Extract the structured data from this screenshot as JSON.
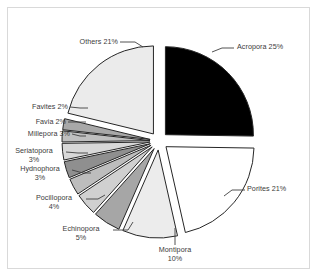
{
  "chart_data": {
    "type": "pie",
    "title": "",
    "subtitle": "",
    "xlabel": "",
    "ylabel": "",
    "legend_position": "none",
    "grid": false,
    "exploded": true,
    "units": "percent",
    "categories": [
      "Acropora",
      "Porites",
      "Montipora",
      "Echinopora",
      "Pocillopora",
      "Hydnophora",
      "Seriatopora",
      "Millepora",
      "Favia",
      "Favites",
      "Others"
    ],
    "values": [
      25,
      21,
      10,
      5,
      4,
      3,
      3,
      3,
      2,
      2,
      21
    ],
    "slice_colors": [
      "#000000",
      "#ffffff",
      "#ececec",
      "#a6a6a6",
      "#d0d0d0",
      "#bdbdbd",
      "#8f8f8f",
      "#d8d8d8",
      "#bfbfbf",
      "#a8a8a8",
      "#ebebeb"
    ],
    "labels": [
      {
        "name": "Acropora",
        "value": 25,
        "text": "Acropora 25%",
        "line1": "Acropora 25%",
        "line2": ""
      },
      {
        "name": "Porites",
        "value": 21,
        "text": "Porites 21%",
        "line1": "Porites 21%",
        "line2": ""
      },
      {
        "name": "Montipora",
        "value": 10,
        "text": "Montipora 10%",
        "line1": "Montipora",
        "line2": "10%"
      },
      {
        "name": "Echinopora",
        "value": 5,
        "text": "Echinopora 5%",
        "line1": "Echinopora",
        "line2": "5%"
      },
      {
        "name": "Pocillopora",
        "value": 4,
        "text": "Pocillopora 4%",
        "line1": "Pocillopora",
        "line2": "4%"
      },
      {
        "name": "Hydnophora",
        "value": 3,
        "text": "Hydnophora 3%",
        "line1": "Hydnophora",
        "line2": "3%"
      },
      {
        "name": "Seriatopora",
        "value": 3,
        "text": "Seriatopora 3%",
        "line1": "Seriatopora",
        "line2": "3%"
      },
      {
        "name": "Millepora",
        "value": 3,
        "text": "Millepora 3%",
        "line1": "Millepora 3%",
        "line2": ""
      },
      {
        "name": "Favia",
        "value": 2,
        "text": "Favia 2%",
        "line1": "Favia 2%",
        "line2": ""
      },
      {
        "name": "Favites",
        "value": 2,
        "text": "Favites 2%",
        "line1": "Favites 2%",
        "line2": ""
      },
      {
        "name": "Others",
        "value": 21,
        "text": "Others 21%",
        "line1": "Others 21%",
        "line2": ""
      }
    ]
  },
  "style": {
    "background": "#ffffff",
    "border_color": "#d9d9d9",
    "outline_color": "#262626",
    "text_color": "#3b3b3b"
  }
}
